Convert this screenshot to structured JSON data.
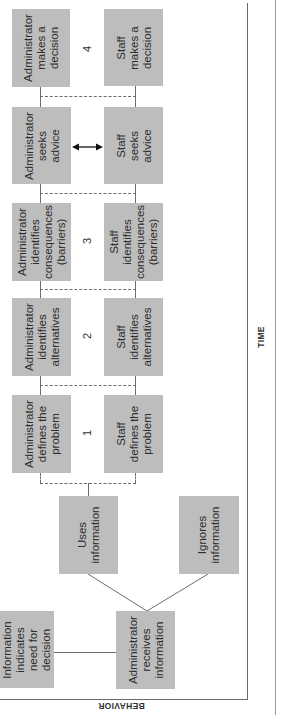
{
  "diagram": {
    "axes": {
      "x_label": "TIME",
      "y_label": "BEHAVIOR"
    },
    "stage_numbers": [
      "1",
      "2",
      "3",
      "4"
    ],
    "boxes": {
      "info_indicates": "Information\nindicates\nneed for\ndecision",
      "admin_receives": "Administrator\nreceives\ninformation",
      "uses_info": "Uses\ninformation",
      "ignores_info": "Ignores\ninformation",
      "admin_defines": "Administrator\ndefines the\nproblem",
      "staff_defines": "Staff\ndefines the\nproblem",
      "admin_alternatives": "Administrator\nidentifies\nalternatives",
      "staff_alternatives": "Staff\nidentifies\nalternatives",
      "admin_consequences": "Administrator\nidentifies\nconsequences\n(barriers)",
      "staff_consequences": "Staff\nidentifies\nconsequences\n(barriers)",
      "admin_advice": "Administrator\nseeks\nadvice",
      "staff_advice": "Staff\nseeks\nadvice",
      "admin_decision": "Administrator\nmakes a\ndecision",
      "staff_decision": "Staff\nmakes a\ndecision"
    },
    "colors": {
      "box_fill": "#bdbdbd",
      "line": "#6d6d6d",
      "background": "#ffffff"
    }
  }
}
